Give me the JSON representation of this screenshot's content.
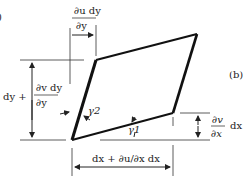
{
  "figure": {
    "panel_label": "(b)",
    "cropped_left_label": ")"
  },
  "labels": {
    "top_num": "∂u dy",
    "top_den": "∂y",
    "left_prefix": "dy +",
    "left_num": "∂v dy",
    "left_den": "∂y",
    "gamma2": "γ2",
    "gamma1": "γ1",
    "right_num": "∂v",
    "right_den": "∂x",
    "right_suffix": "dx",
    "bottom": "dx + ∂u/∂x dx"
  },
  "colors": {
    "stroke": "#111111",
    "thin": "#333333",
    "background": "#ffffff"
  }
}
